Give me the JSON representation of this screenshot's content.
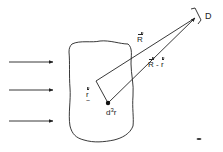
{
  "diagram": {
    "type": "scattering-geometry",
    "colors": {
      "ink": "#222222",
      "background": "#ffffff"
    },
    "incident_arrows": {
      "count": 3,
      "direction": "right"
    },
    "labels": {
      "R": "R",
      "R_minus_r_R": "R",
      "R_minus_r_op": " - ",
      "R_minus_r_r": "r",
      "r": "r",
      "r_tilde": "~",
      "volume_element_d": "d",
      "volume_element_exp": "3",
      "volume_element_r": "r",
      "detector": "D"
    }
  }
}
